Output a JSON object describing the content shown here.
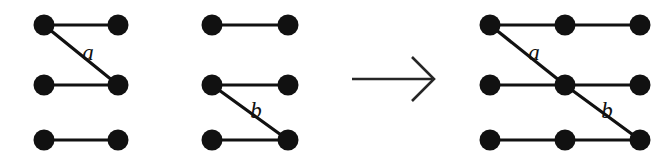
{
  "figure": {
    "background_color": "#ffffff",
    "ink_color": "#111111",
    "arrow_color": "#262626",
    "node_radius": 10.5,
    "edge_width": 3.2,
    "row_y": [
      25,
      85,
      140
    ],
    "panels": [
      {
        "id": "left-graph",
        "name": "first-operand-graph",
        "columns_x": [
          44,
          118
        ],
        "nodes": [
          {
            "id": "L-r1c1",
            "row": 1,
            "col": 1,
            "cx": 44,
            "cy": 25
          },
          {
            "id": "L-r1c2",
            "row": 1,
            "col": 2,
            "cx": 118,
            "cy": 25
          },
          {
            "id": "L-r2c1",
            "row": 2,
            "col": 1,
            "cx": 44,
            "cy": 85
          },
          {
            "id": "L-r2c2",
            "row": 2,
            "col": 2,
            "cx": 118,
            "cy": 85
          },
          {
            "id": "L-r3c1",
            "row": 3,
            "col": 1,
            "cx": 44,
            "cy": 140
          },
          {
            "id": "L-r3c2",
            "row": 3,
            "col": 2,
            "cx": 118,
            "cy": 140
          }
        ],
        "edges": [
          {
            "id": "L-e1",
            "kind": "horizontal",
            "x1": 44,
            "y1": 25,
            "x2": 118,
            "y2": 25,
            "label": ""
          },
          {
            "id": "L-e2",
            "kind": "horizontal",
            "x1": 44,
            "y1": 85,
            "x2": 118,
            "y2": 85,
            "label": ""
          },
          {
            "id": "L-e3",
            "kind": "horizontal",
            "x1": 44,
            "y1": 140,
            "x2": 118,
            "y2": 140,
            "label": ""
          },
          {
            "id": "L-e4",
            "kind": "diagonal",
            "x1": 44,
            "y1": 25,
            "x2": 118,
            "y2": 85,
            "label": "a"
          }
        ],
        "labels": [
          {
            "id": "L-lbl-a",
            "text": "a",
            "x": 88,
            "y": 60
          }
        ]
      },
      {
        "id": "middle-graph",
        "name": "second-operand-graph",
        "columns_x": [
          212,
          288
        ],
        "nodes": [
          {
            "id": "M-r1c1",
            "row": 1,
            "col": 1,
            "cx": 212,
            "cy": 25
          },
          {
            "id": "M-r1c2",
            "row": 1,
            "col": 2,
            "cx": 288,
            "cy": 25
          },
          {
            "id": "M-r2c1",
            "row": 2,
            "col": 1,
            "cx": 212,
            "cy": 85
          },
          {
            "id": "M-r2c2",
            "row": 2,
            "col": 2,
            "cx": 288,
            "cy": 85
          },
          {
            "id": "M-r3c1",
            "row": 3,
            "col": 1,
            "cx": 212,
            "cy": 140
          },
          {
            "id": "M-r3c2",
            "row": 3,
            "col": 2,
            "cx": 288,
            "cy": 140
          }
        ],
        "edges": [
          {
            "id": "M-e1",
            "kind": "horizontal",
            "x1": 212,
            "y1": 25,
            "x2": 288,
            "y2": 25,
            "label": ""
          },
          {
            "id": "M-e2",
            "kind": "horizontal",
            "x1": 212,
            "y1": 85,
            "x2": 288,
            "y2": 85,
            "label": ""
          },
          {
            "id": "M-e3",
            "kind": "horizontal",
            "x1": 212,
            "y1": 140,
            "x2": 288,
            "y2": 140,
            "label": ""
          },
          {
            "id": "M-e4",
            "kind": "diagonal",
            "x1": 212,
            "y1": 85,
            "x2": 288,
            "y2": 140,
            "label": "b"
          }
        ],
        "labels": [
          {
            "id": "M-lbl-b",
            "text": "b",
            "x": 256,
            "y": 118
          }
        ]
      },
      {
        "id": "right-graph",
        "name": "result-graph",
        "columns_x": [
          490,
          565,
          640
        ],
        "nodes": [
          {
            "id": "R-r1c1",
            "row": 1,
            "col": 1,
            "cx": 490,
            "cy": 25
          },
          {
            "id": "R-r1c2",
            "row": 1,
            "col": 2,
            "cx": 565,
            "cy": 25
          },
          {
            "id": "R-r1c3",
            "row": 1,
            "col": 3,
            "cx": 640,
            "cy": 25
          },
          {
            "id": "R-r2c1",
            "row": 2,
            "col": 1,
            "cx": 490,
            "cy": 85
          },
          {
            "id": "R-r2c2",
            "row": 2,
            "col": 2,
            "cx": 565,
            "cy": 85
          },
          {
            "id": "R-r2c3",
            "row": 2,
            "col": 3,
            "cx": 640,
            "cy": 85
          },
          {
            "id": "R-r3c1",
            "row": 3,
            "col": 1,
            "cx": 490,
            "cy": 140
          },
          {
            "id": "R-r3c2",
            "row": 3,
            "col": 2,
            "cx": 565,
            "cy": 140
          },
          {
            "id": "R-r3c3",
            "row": 3,
            "col": 3,
            "cx": 640,
            "cy": 140
          }
        ],
        "edges": [
          {
            "id": "R-e1",
            "kind": "horizontal",
            "x1": 490,
            "y1": 25,
            "x2": 640,
            "y2": 25,
            "label": ""
          },
          {
            "id": "R-e2",
            "kind": "horizontal",
            "x1": 490,
            "y1": 85,
            "x2": 640,
            "y2": 85,
            "label": ""
          },
          {
            "id": "R-e3",
            "kind": "horizontal",
            "x1": 490,
            "y1": 140,
            "x2": 640,
            "y2": 140,
            "label": ""
          },
          {
            "id": "R-e4",
            "kind": "diagonal",
            "x1": 490,
            "y1": 25,
            "x2": 565,
            "y2": 85,
            "label": "a"
          },
          {
            "id": "R-e5",
            "kind": "diagonal",
            "x1": 565,
            "y1": 85,
            "x2": 640,
            "y2": 140,
            "label": "b"
          }
        ],
        "labels": [
          {
            "id": "R-lbl-a",
            "text": "a",
            "x": 534,
            "y": 60
          },
          {
            "id": "R-lbl-b",
            "text": "b",
            "x": 607,
            "y": 118
          }
        ]
      }
    ],
    "arrow": {
      "id": "transform-arrow",
      "symbol": "→",
      "x1": 352,
      "y1": 79,
      "x2": 434,
      "y2": 79,
      "head_upper_x": 412,
      "head_upper_y": 57,
      "head_lower_x": 412,
      "head_lower_y": 101
    }
  }
}
